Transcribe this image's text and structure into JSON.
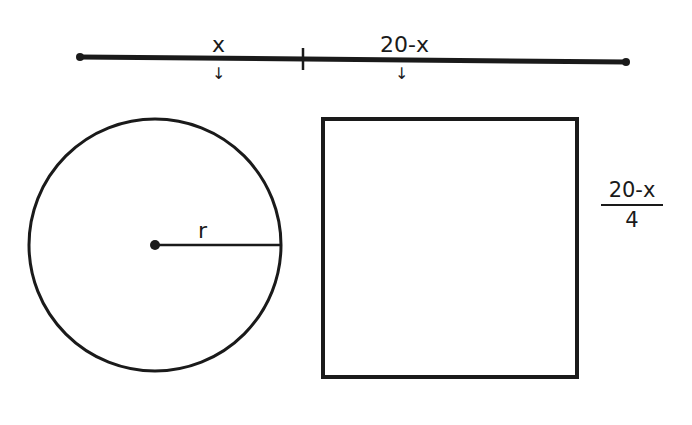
{
  "segment": {
    "left_label": "x",
    "right_label": "20-x",
    "arrow_glyph": "↓"
  },
  "circle": {
    "radius_label": "r"
  },
  "square": {
    "side_label_numerator": "20-x",
    "side_label_denominator": "4"
  },
  "colors": {
    "ink": "#1a1a1a",
    "background": "#ffffff"
  }
}
